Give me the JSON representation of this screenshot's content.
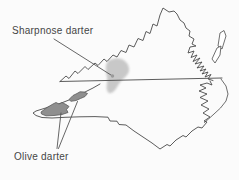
{
  "figure": {
    "kind": "species range map",
    "annotations": {
      "sharpnose": {
        "label": "Sharpnose darter",
        "range_count": 1
      },
      "olive": {
        "label": "Olive darter",
        "range_count": 2
      }
    }
  },
  "colors": {
    "bg": "#fbfbfb",
    "outline": "#4a4a4a",
    "text": "#454545",
    "range_light": "#c6c6c6",
    "range_dark": "#8f8f8f",
    "range_dark_stroke": "#5c5c5c",
    "leader": "#555555"
  }
}
